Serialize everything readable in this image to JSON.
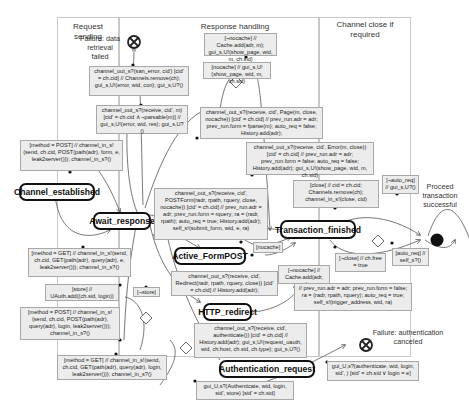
{
  "lanes": [
    {
      "id": "request-sending",
      "title": "Request sending"
    },
    {
      "id": "response-handling",
      "title": "Response handling"
    },
    {
      "id": "channel-close",
      "title": "Channel close if required"
    }
  ],
  "states": {
    "channel_established": "Channel_established",
    "await_response": "Await_response",
    "active_formpost": "Active_FormPOST",
    "transaction_finished": "Transaction_finished",
    "http_redirect": "HTTP_redirect",
    "authentication_request": "Authentication_request"
  },
  "terminals": {
    "failure_data": "Failure: data retrieval failed",
    "proceed": "Proceed transaction successful",
    "failure_auth": "Failure: authentication canceled"
  },
  "transitions": {
    "san_error": "channel_out_s?(san_error, cid') [cid' = ch.cid] // Channels.remove(ch); gui_s,U!(error, wid, con); gui_s,U?()",
    "parsable_error": "channel_out_s?(receive, cid', m) [cid' = ch.cid ∧ ¬parsable(m)] // gui_s,U!(error, wid, res); gui_s,U?()",
    "not_nocache_cache": "[¬nocache] // Cache.add(adr, m); gui_s,U!(show_page, wid, m, ch.sid)",
    "nocache_show": "[nocache] // gui_s,U!(show_page, wid, m, ch.sid)",
    "receive_page": "channel_out_s?(receive, cid', Page(m, close, nocache)) [cid' = ch.cid] // prev_run.adr = adr; prev_run.form = fparse(m); auto_req = false; History.add(adr);",
    "receive_error": "channel_out_s?(receive, cid', Error(m, close)) [cid' = ch.cid] // prev_run.adr = adr; prev_run.form = false; auto_req = false; History.add(adr); gui_s,U!(show_page, wid, m, ch.sid)",
    "post_send_top": "[method = POST] // channel_in_s!(send, ch.cid, POST(path(adr), form, e, leak2server())); channel_in_s?()",
    "receive_formpost": "channel_out_s?(receive, cid', POSTForm(radr, rpath, rquery, close, nocache)) [cid' = ch.cid] // prev_run.adr = adr; prev_run.form = rquery; ra = (radr, rpath); auto_req = true; History.add(adr); self_s!(submit_form, wid, e, ra)",
    "close_remove": "[close] // cid = ch.cid; Channels.remove(ch); channel_in_s!(close, cid)",
    "not_auto_req": "[¬auto_req] // gui_s,U?()",
    "auto_req": "[auto_req] // self_s?()",
    "not_close": "[¬close] // ch.free = true",
    "get_send_top": "[method = GET] // channel_in_s!(send, ch.cid, GET(path(adr), query(adr), e, leak2server())); channel_in_s?()",
    "nocache_label": "[nocache]",
    "not_nocache_add": "[¬nocache] // Cache.add(adr, m)",
    "receive_redirect": "channel_out_s?(receive, cid', Redirect(radr, rpath, rquery, close)) [cid' = ch.cid] // History.add(adr);",
    "prev_run_redirect": "// prev_run.adr = adr; prev_run.form = false; ra = (radr, rpath, rquery); auto_req = true; self_s!(trigger_address, wid, ra)",
    "store": "[store] // UAuth.add((ch.sid, login))",
    "not_store": "[¬store]",
    "post_send_login": "[method = POST] // channel_in_s!(send, ch.cid, POST(path(adr), query(adr), login, leak2server())); channel_in_s?()",
    "receive_authenticate": "channel_out_s?(receive, cid', authenticate()) [cid' = ch.cid] // History.add(adr); gui_s,U!(request_uauth, wid, ch.host, ch.sid, ch.type); gui_s,U?()",
    "get_send_login": "[method = GET] // channel_in_s!(send, ch.cid, GET(path(adr), query(adr), login, leak2server())); channel_in_s?()",
    "gui_authenticate": "gui_U,s?(Authenticate, wid, login, sid', store) [sid' = ch.sid]",
    "gui_auth_cancel": "gui_U,s?(authenticate, wid, login, sid', ) [sid' = ch.sid ∨ login = e]"
  }
}
